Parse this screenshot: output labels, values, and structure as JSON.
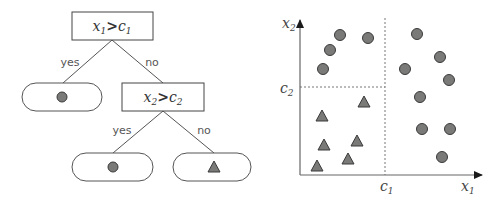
{
  "colors": {
    "stroke": "#444444",
    "marker_fill": "#7a7a78",
    "marker_stroke": "#3a3a3a",
    "axis": "#555555",
    "dashed": "#777777",
    "edge_label": "#444444"
  },
  "tree": {
    "root": {
      "var": "x",
      "var_sub": "1",
      "op": ">",
      "thr": "c",
      "thr_sub": "1"
    },
    "root_edges": {
      "left": "yes",
      "right": "no"
    },
    "left_leaf": {
      "symbol": "circle"
    },
    "inner": {
      "var": "x",
      "var_sub": "2",
      "op": ">",
      "thr": "c",
      "thr_sub": "2"
    },
    "inner_edges": {
      "left": "yes",
      "right": "no"
    },
    "inner_left_leaf": {
      "symbol": "circle"
    },
    "inner_right_leaf": {
      "symbol": "triangle"
    }
  },
  "plot": {
    "x_axis_label": "x",
    "x_axis_sub": "1",
    "y_axis_label": "x",
    "y_axis_sub": "2",
    "c1_label": "c",
    "c1_sub": "1",
    "c2_label": "c",
    "c2_sub": "2"
  },
  "chart_data": {
    "type": "scatter",
    "title": "",
    "xlabel": "x1",
    "ylabel": "x2",
    "grid": false,
    "thresholds": {
      "c1_px_x": 385,
      "c2_px_y": 87
    },
    "series": [
      {
        "name": "circle",
        "points_px": [
          [
            340,
            35
          ],
          [
            368,
            38
          ],
          [
            330,
            50
          ],
          [
            323,
            69
          ],
          [
            417,
            34
          ],
          [
            440,
            57
          ],
          [
            405,
            69
          ],
          [
            449,
            80
          ],
          [
            420,
            97
          ],
          [
            422,
            129
          ],
          [
            450,
            129
          ],
          [
            442,
            157
          ]
        ]
      },
      {
        "name": "triangle",
        "points_px": [
          [
            364,
            102
          ],
          [
            322,
            116
          ],
          [
            357,
            141
          ],
          [
            324,
            145
          ],
          [
            348,
            159
          ],
          [
            317,
            166
          ]
        ]
      }
    ]
  }
}
